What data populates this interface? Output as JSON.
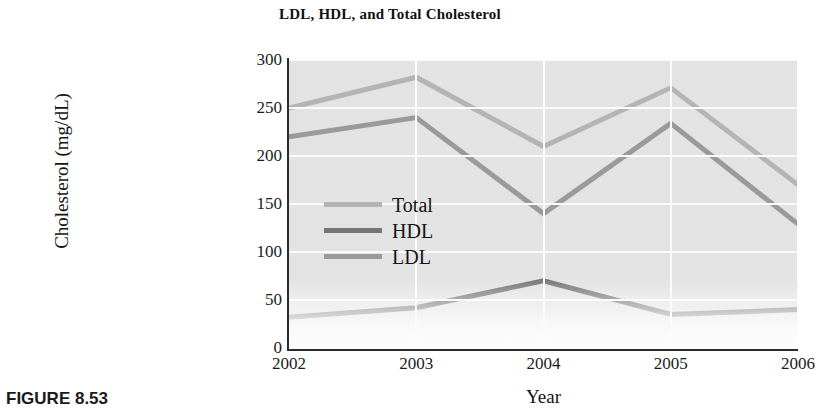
{
  "chart_data": {
    "type": "line",
    "title": "LDL, HDL, and Total Cholesterol",
    "xlabel": "Year",
    "ylabel": "Cholesterol (mg/dL)",
    "x": [
      2002,
      2003,
      2004,
      2005,
      2006
    ],
    "xtick_labels": [
      "2002",
      "2003",
      "2004",
      "2005",
      "2006"
    ],
    "ytick_labels": [
      "0",
      "50",
      "100",
      "150",
      "200",
      "250",
      "300"
    ],
    "yticks": [
      0,
      50,
      100,
      150,
      200,
      250,
      300
    ],
    "ylim": [
      0,
      300
    ],
    "xlim": [
      2002,
      2006
    ],
    "grid": true,
    "grid_color": "#fbfbfb",
    "plot_background": "#e3e3e3",
    "legend_position": "center-left inside plot",
    "series": [
      {
        "name": "Total",
        "color": "#b4b4b4",
        "values": [
          250,
          282,
          210,
          271,
          170
        ]
      },
      {
        "name": "HDL",
        "color": "#767676",
        "values": [
          32,
          42,
          70,
          35,
          40
        ]
      },
      {
        "name": "LDL",
        "color": "#9a9a9a",
        "values": [
          220,
          240,
          140,
          234,
          129
        ]
      }
    ]
  },
  "legend": {
    "entries": [
      {
        "label": "Total"
      },
      {
        "label": "HDL"
      },
      {
        "label": "LDL"
      }
    ]
  },
  "caption": {
    "text": "FIGURE 8.53"
  }
}
